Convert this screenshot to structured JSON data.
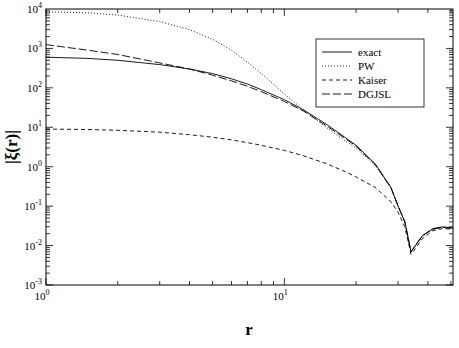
{
  "chart_data": {
    "type": "line",
    "title": "",
    "xlabel": "r",
    "ylabel": "|ξ(r)|",
    "xscale": "log",
    "yscale": "log",
    "xlim": [
      1,
      51
    ],
    "ylim": [
      0.001,
      10000
    ],
    "grid": false,
    "legend_position": "upper right",
    "x_ticks": [
      {
        "base": "10",
        "exp": "0",
        "value": 1
      },
      {
        "base": "10",
        "exp": "1",
        "value": 10
      }
    ],
    "y_ticks": [
      {
        "base": "10",
        "exp": "-3",
        "value": 0.001
      },
      {
        "base": "10",
        "exp": "-2",
        "value": 0.01
      },
      {
        "base": "10",
        "exp": "-1",
        "value": 0.1
      },
      {
        "base": "10",
        "exp": "0",
        "value": 1
      },
      {
        "base": "10",
        "exp": "1",
        "value": 10
      },
      {
        "base": "10",
        "exp": "2",
        "value": 100
      },
      {
        "base": "10",
        "exp": "3",
        "value": 1000
      },
      {
        "base": "10",
        "exp": "4",
        "value": 10000
      }
    ],
    "x": [
      1,
      1.5,
      2,
      3,
      4,
      5,
      6,
      7,
      8,
      10,
      12,
      15,
      18,
      20,
      24,
      28,
      30,
      32,
      34,
      38,
      42,
      46,
      51
    ],
    "series": [
      {
        "name": "exact",
        "style": "solid",
        "values": [
          600,
          560,
          500,
          390,
          300,
          230,
          170,
          125,
          90,
          50,
          28,
          12,
          5.5,
          3.5,
          1.2,
          0.3,
          0.1,
          0.04,
          0.007,
          0.018,
          0.027,
          0.03,
          0.028
        ]
      },
      {
        "name": "PW",
        "style": "dotted",
        "values": [
          8500,
          8000,
          7000,
          4800,
          3000,
          1700,
          900,
          450,
          230,
          70,
          28,
          10,
          4.5,
          3.0,
          1.1,
          0.3,
          0.1,
          0.04,
          0.007,
          0.017,
          0.026,
          0.029,
          0.027
        ]
      },
      {
        "name": "Kaiser",
        "style": "dashed",
        "values": [
          9,
          8.8,
          8.4,
          7.5,
          6.5,
          5.6,
          4.8,
          4.1,
          3.5,
          2.6,
          1.9,
          1.2,
          0.75,
          0.55,
          0.3,
          0.13,
          0.07,
          0.03,
          0.006,
          0.015,
          0.024,
          0.027,
          0.026
        ]
      },
      {
        "name": "DGJSL",
        "style": "long-dashed",
        "values": [
          1250,
          900,
          700,
          430,
          300,
          210,
          150,
          110,
          80,
          45,
          26,
          11,
          5.2,
          3.3,
          1.15,
          0.29,
          0.1,
          0.04,
          0.007,
          0.018,
          0.026,
          0.029,
          0.027
        ]
      }
    ]
  }
}
